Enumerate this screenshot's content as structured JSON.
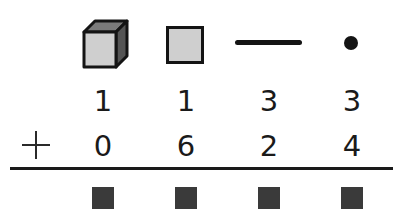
{
  "header_icons": [
    {
      "name": "thousands-cube",
      "label": "cube (thousand block)"
    },
    {
      "name": "hundreds-flat",
      "label": "flat (hundred block)"
    },
    {
      "name": "tens-rod",
      "label": "rod (ten)"
    },
    {
      "name": "ones-unit",
      "label": "unit (one)"
    }
  ],
  "problem": {
    "operator": "+",
    "addend1": [
      "1",
      "1",
      "3",
      "3"
    ],
    "addend2": [
      "0",
      "6",
      "2",
      "4"
    ],
    "answer_placeholders": 4
  },
  "colors": {
    "ink": "#1a1a1a",
    "block_fill": "#cfcfcf",
    "cube_side": "#5a5a5a",
    "answer_box": "#3a3a3a"
  }
}
